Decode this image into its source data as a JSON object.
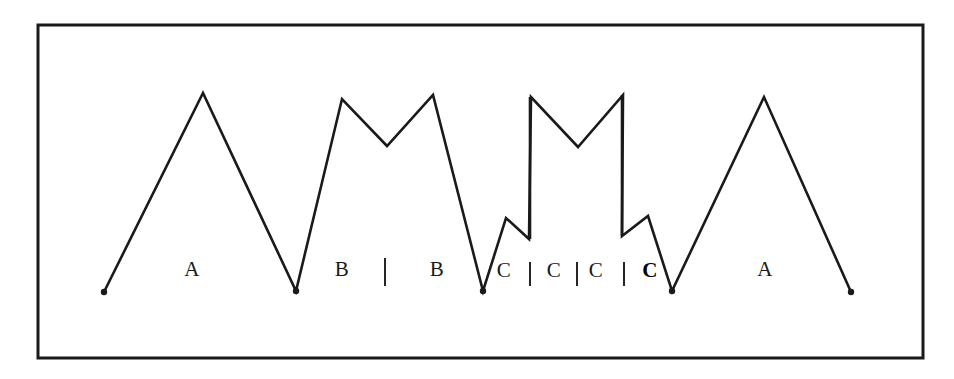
{
  "figure": {
    "type": "hand-drawn-zigzag-waveform-diagram",
    "background_color": "#ffffff",
    "stroke_color": "#1a1a1a",
    "frame": {
      "name": "outer-rectangle-border",
      "x": 38,
      "y": 25,
      "width": 885,
      "height": 333,
      "stroke_width": 3,
      "color": "#1a1a1a"
    },
    "polyline_points": "104,292 203,93 296,291 342,99 387,146 433,95 483,291 506,218 529,239 531,97 578,147 623,95 622,236 648,216 672,291 764,97 851,292",
    "vertical_segments": [
      {
        "name": "riser-left",
        "x": 530,
        "y_top": 97,
        "y_bottom": 239
      },
      {
        "name": "riser-right",
        "x": 622,
        "y_top": 95,
        "y_bottom": 236
      }
    ],
    "endpoint_dots": [
      {
        "name": "start-dot",
        "x": 104,
        "y": 292
      },
      {
        "name": "end-dot",
        "x": 851,
        "y": 292
      },
      {
        "name": "valley-dot-1",
        "x": 296,
        "y": 291
      },
      {
        "name": "valley-dot-2",
        "x": 483,
        "y": 291
      },
      {
        "name": "valley-dot-3",
        "x": 672,
        "y": 291
      }
    ],
    "labels": [
      {
        "id": "label-a-left",
        "text": "A",
        "x": 192,
        "y": 269,
        "bold": false
      },
      {
        "id": "label-b-left",
        "text": "B",
        "x": 342,
        "y": 269,
        "bold": false
      },
      {
        "id": "label-b-right",
        "text": "B",
        "x": 437,
        "y": 269,
        "bold": false
      },
      {
        "id": "label-c-1",
        "text": "C",
        "x": 504,
        "y": 270,
        "bold": false
      },
      {
        "id": "label-c-2",
        "text": "C",
        "x": 554,
        "y": 270,
        "bold": false
      },
      {
        "id": "label-c-3",
        "text": "C",
        "x": 596,
        "y": 270,
        "bold": false
      },
      {
        "id": "label-c-4",
        "text": "C",
        "x": 650,
        "y": 270,
        "bold": true
      },
      {
        "id": "label-a-right",
        "text": "A",
        "x": 765,
        "y": 269,
        "bold": false
      }
    ],
    "tick_marks": [
      {
        "id": "tick-between-b-b",
        "x": 385,
        "y": 258,
        "height": 28
      },
      {
        "id": "tick-c1-c2",
        "x": 530,
        "y": 262,
        "height": 24
      },
      {
        "id": "tick-c2-c3",
        "x": 577,
        "y": 262,
        "height": 24
      },
      {
        "id": "tick-c3-c4",
        "x": 624,
        "y": 262,
        "height": 24
      }
    ]
  }
}
